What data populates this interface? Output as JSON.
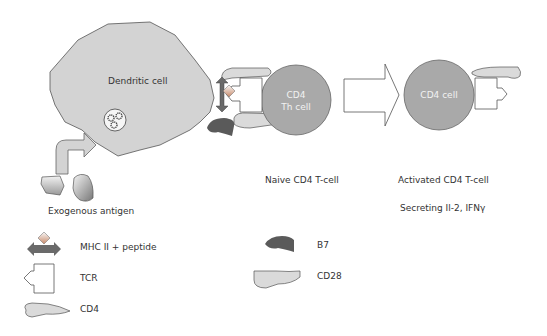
{
  "diagram": {
    "dendritic_cell": {
      "label": "Dendritic cell"
    },
    "naive_cell": {
      "label_line1": "CD4",
      "label_line2": "Th cell",
      "caption": "Naive CD4 T-cell"
    },
    "activated_cell": {
      "label": "CD4 cell",
      "caption": "Activated CD4 T-cell",
      "secretion": "Secreting Il-2, IFNγ"
    },
    "antigen": {
      "label": "Exogenous antigen"
    }
  },
  "legend": {
    "items": [
      {
        "name": "mhc-peptide",
        "label": "MHC II + peptide"
      },
      {
        "name": "tcr",
        "label": "TCR"
      },
      {
        "name": "cd4",
        "label": "CD4"
      },
      {
        "name": "b7",
        "label": "B7"
      },
      {
        "name": "cd28",
        "label": "CD28"
      }
    ]
  },
  "colors": {
    "dendritic_fill": "#d3d3d3",
    "tcell_fill": "#a9a9a9",
    "b7_fill": "#5a5a5a",
    "mhc_fill": "#6a6a6a",
    "cd_fill": "#dadada",
    "stroke": "#555555"
  }
}
